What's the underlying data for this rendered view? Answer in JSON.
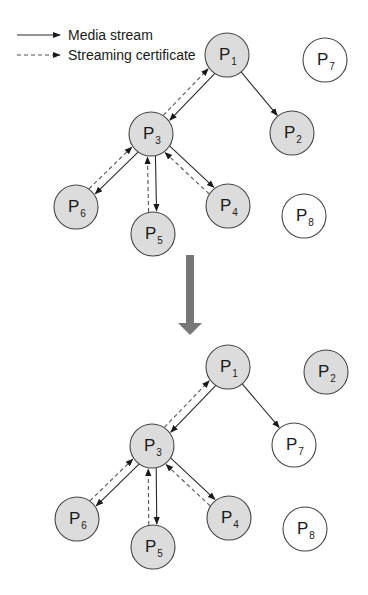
{
  "legend": {
    "items": [
      {
        "label": "Media stream",
        "style": "solid"
      },
      {
        "label": "Streaming certificate",
        "style": "dashed"
      }
    ]
  },
  "colors": {
    "active_node_fill": "#dcdcdc",
    "idle_node_fill": "#ffffff",
    "transition_arrow": "#777777",
    "edge": "#2a2a2a"
  },
  "diagrams": [
    {
      "name": "before",
      "nodes": [
        {
          "id": "P1",
          "base": "P",
          "sub": "1",
          "x": 227,
          "y": 55,
          "active": true
        },
        {
          "id": "P2",
          "base": "P",
          "sub": "2",
          "x": 292,
          "y": 133,
          "active": true
        },
        {
          "id": "P3",
          "base": "P",
          "sub": "3",
          "x": 151,
          "y": 134,
          "active": true
        },
        {
          "id": "P4",
          "base": "P",
          "sub": "4",
          "x": 228,
          "y": 206,
          "active": true
        },
        {
          "id": "P5",
          "base": "P",
          "sub": "5",
          "x": 153,
          "y": 234,
          "active": true
        },
        {
          "id": "P6",
          "base": "P",
          "sub": "6",
          "x": 76,
          "y": 207,
          "active": true
        },
        {
          "id": "P7",
          "base": "P",
          "sub": "7",
          "x": 325,
          "y": 60,
          "active": false
        },
        {
          "id": "P8",
          "base": "P",
          "sub": "8",
          "x": 304,
          "y": 216,
          "active": false
        }
      ],
      "media_edges": [
        [
          "P1",
          "P3"
        ],
        [
          "P1",
          "P2"
        ],
        [
          "P3",
          "P6"
        ],
        [
          "P3",
          "P5"
        ],
        [
          "P3",
          "P4"
        ]
      ],
      "certificate_edges": [
        [
          "P3",
          "P1"
        ],
        [
          "P6",
          "P3"
        ],
        [
          "P5",
          "P3"
        ],
        [
          "P4",
          "P3"
        ]
      ]
    },
    {
      "name": "after",
      "nodes": [
        {
          "id": "P1",
          "base": "P",
          "sub": "1",
          "x": 228,
          "y": 367,
          "active": true
        },
        {
          "id": "P2",
          "base": "P",
          "sub": "2",
          "x": 326,
          "y": 372,
          "active": true
        },
        {
          "id": "P3",
          "base": "P",
          "sub": "3",
          "x": 152,
          "y": 446,
          "active": true
        },
        {
          "id": "P4",
          "base": "P",
          "sub": "4",
          "x": 229,
          "y": 518,
          "active": true
        },
        {
          "id": "P5",
          "base": "P",
          "sub": "5",
          "x": 153,
          "y": 547,
          "active": true
        },
        {
          "id": "P6",
          "base": "P",
          "sub": "6",
          "x": 77,
          "y": 519,
          "active": true
        },
        {
          "id": "P7",
          "base": "P",
          "sub": "7",
          "x": 294,
          "y": 445,
          "active": false
        },
        {
          "id": "P8",
          "base": "P",
          "sub": "8",
          "x": 305,
          "y": 529,
          "active": false
        }
      ],
      "media_edges": [
        [
          "P1",
          "P3"
        ],
        [
          "P1",
          "P7"
        ],
        [
          "P3",
          "P6"
        ],
        [
          "P3",
          "P5"
        ],
        [
          "P3",
          "P4"
        ]
      ],
      "certificate_edges": [
        [
          "P3",
          "P1"
        ],
        [
          "P6",
          "P3"
        ],
        [
          "P5",
          "P3"
        ],
        [
          "P4",
          "P3"
        ]
      ]
    }
  ],
  "transition_arrow": {
    "x": 190,
    "y_start": 255,
    "y_end": 335
  }
}
